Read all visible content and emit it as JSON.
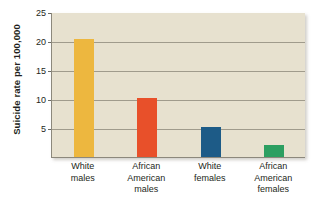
{
  "chart_data": {
    "type": "bar",
    "title": "",
    "subtitle": "",
    "xlabel": "",
    "ylabel": "Suicide rate per 100,000",
    "categories": [
      "White males",
      "African American males",
      "White females",
      "African American females"
    ],
    "category_lines": [
      [
        "White",
        "males"
      ],
      [
        "African",
        "American",
        "males"
      ],
      [
        "White",
        "females"
      ],
      [
        "African",
        "American",
        "females"
      ]
    ],
    "values": [
      20.3,
      10.2,
      5.2,
      2.0
    ],
    "bar_colors": [
      "#edb73f",
      "#e8502a",
      "#1d5b87",
      "#2c9f61"
    ],
    "ylim": [
      0,
      25
    ],
    "yticks": [
      5,
      10,
      15,
      20,
      25
    ],
    "ytick_labels": [
      "5",
      "10",
      "15",
      "20",
      "25"
    ],
    "grid": true,
    "grid_axis": "y",
    "legend": false,
    "legend_position": "none",
    "plot_background": "#e7e1cf",
    "figure_background": "#ffffff",
    "axis_color": "#8c887c",
    "grid_color": "#a09b8c"
  }
}
